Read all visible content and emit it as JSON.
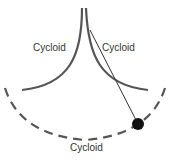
{
  "diagram": {
    "labels": {
      "left_cycloid": "Cycloid",
      "right_cycloid": "Cycloid",
      "bottom_cycloid": "Cycloid"
    },
    "colors": {
      "curve": "#555555",
      "string": "#333333",
      "bob": "#111111"
    }
  }
}
